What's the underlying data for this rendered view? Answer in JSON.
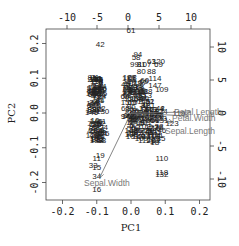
{
  "chart_data": {
    "type": "scatter",
    "subtype": "biplot",
    "title": "",
    "xlabel": "PC1",
    "ylabel": "PC2",
    "xlim": [
      -0.25,
      0.25
    ],
    "ylim": [
      -0.22,
      0.25
    ],
    "x_ticks": [
      "-0.2",
      "-0.1",
      "0.0",
      "0.1",
      "0.2"
    ],
    "y_ticks": [
      "-0.2",
      "-0.1",
      "0.0",
      "0.1",
      "0.2"
    ],
    "top_ticks": [
      "-10",
      "-5",
      "0",
      "5",
      "10"
    ],
    "right_ticks": [
      "10",
      "5",
      "0",
      "-5",
      "-10"
    ],
    "grid": false,
    "legend": null,
    "points": [
      {
        "label": "61",
        "x": 0.0,
        "y": 0.24
      },
      {
        "label": "42",
        "x": -0.09,
        "y": 0.2
      },
      {
        "label": "94",
        "x": 0.02,
        "y": 0.17
      },
      {
        "label": "58",
        "x": 0.015,
        "y": 0.16
      },
      {
        "label": "99",
        "x": 0.01,
        "y": 0.14
      },
      {
        "label": "81",
        "x": 0.03,
        "y": 0.14
      },
      {
        "label": "107",
        "x": 0.04,
        "y": 0.14
      },
      {
        "label": "63",
        "x": 0.06,
        "y": 0.15
      },
      {
        "label": "120",
        "x": 0.08,
        "y": 0.15
      },
      {
        "label": "69",
        "x": 0.08,
        "y": 0.14
      },
      {
        "label": "80",
        "x": 0.03,
        "y": 0.12
      },
      {
        "label": "88",
        "x": 0.06,
        "y": 0.12
      },
      {
        "label": "114",
        "x": 0.07,
        "y": 0.1
      },
      {
        "label": "147",
        "x": 0.07,
        "y": 0.08
      },
      {
        "label": "109",
        "x": 0.09,
        "y": 0.07
      },
      {
        "label": "9",
        "x": -0.09,
        "y": 0.09
      },
      {
        "label": "14",
        "x": -0.1,
        "y": 0.08
      },
      {
        "label": "39",
        "x": -0.1,
        "y": 0.07
      },
      {
        "label": "4",
        "x": -0.11,
        "y": 0.05
      },
      {
        "label": "24",
        "x": -0.08,
        "y": -0.04
      },
      {
        "label": "23",
        "x": -0.11,
        "y": -0.05
      },
      {
        "label": "38",
        "x": -0.1,
        "y": -0.06
      },
      {
        "label": "37",
        "x": -0.09,
        "y": -0.06
      },
      {
        "label": "19",
        "x": -0.09,
        "y": -0.12
      },
      {
        "label": "11",
        "x": -0.1,
        "y": -0.13
      },
      {
        "label": "33",
        "x": -0.11,
        "y": -0.15
      },
      {
        "label": "15",
        "x": -0.1,
        "y": -0.155
      },
      {
        "label": "34",
        "x": -0.1,
        "y": -0.18
      },
      {
        "label": "16",
        "x": -0.1,
        "y": -0.22
      },
      {
        "label": "119",
        "x": 0.14,
        "y": 0.0
      },
      {
        "label": "123",
        "x": 0.12,
        "y": -0.03
      },
      {
        "label": "131",
        "x": 0.09,
        "y": -0.02
      },
      {
        "label": "86",
        "x": 0.02,
        "y": -0.05
      },
      {
        "label": "110",
        "x": 0.09,
        "y": -0.13
      },
      {
        "label": "118",
        "x": 0.09,
        "y": -0.17
      },
      {
        "label": "132",
        "x": 0.09,
        "y": -0.175
      }
    ],
    "loadings": [
      {
        "name": "Petal.Length",
        "x": 0.17,
        "y": 0.0
      },
      {
        "name": "Petal.Width",
        "x": 0.165,
        "y": -0.01
      },
      {
        "name": "Sepal.Length",
        "x": 0.12,
        "y": -0.03
      },
      {
        "name": "Sepal.Width",
        "x": -0.09,
        "y": -0.19
      }
    ]
  },
  "labels": {
    "xlabel": "PC1",
    "ylabel": "PC2",
    "var_petal_length": "Petal.Length",
    "var_petal_width": "Petal.Width",
    "var_sepal_length": "Sepal.Length",
    "var_sepal_width": "Sepal.Width"
  }
}
